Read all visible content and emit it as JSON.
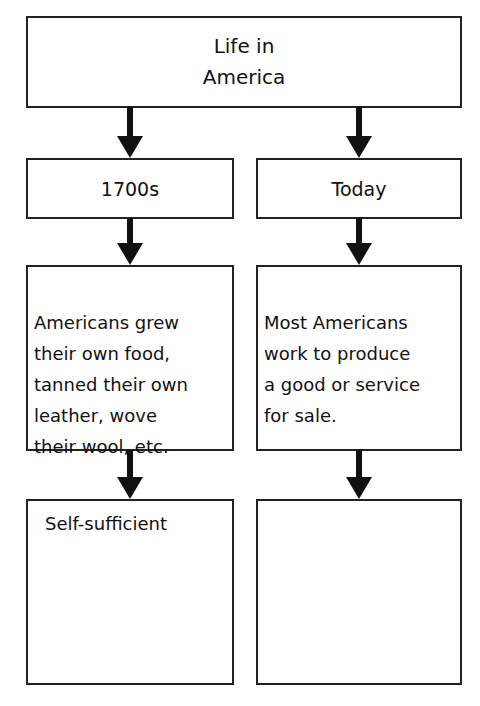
{
  "diagram": {
    "title": "Life in\nAmerica",
    "columns": [
      {
        "era": "1700s",
        "description": "Americans grew\ntheir own food,\ntanned their own\nleather, wove\ntheir wool, etc.",
        "result": "Self-sufficient"
      },
      {
        "era": "Today",
        "description": "Most Americans\nwork to produce\na good or service\nfor sale.",
        "result": ""
      }
    ],
    "colors": {
      "border": "#222222",
      "arrow": "#111111",
      "background": "#ffffff"
    }
  }
}
